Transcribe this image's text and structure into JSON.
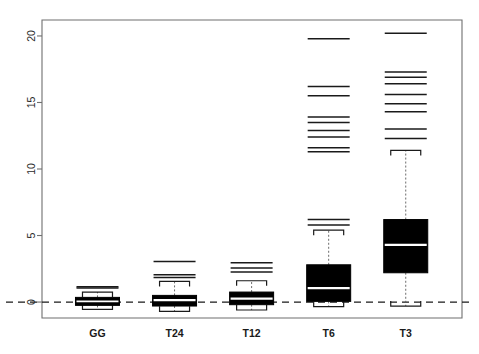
{
  "chart_data": {
    "type": "boxplot",
    "title": "",
    "xlabel": "",
    "ylabel": "",
    "categories": [
      "GG",
      "T24",
      "T12",
      "T6",
      "T3"
    ],
    "ylim": [
      -1.2,
      21.2
    ],
    "yticks": [
      0,
      5,
      10,
      15,
      20
    ],
    "ytick_labels": [
      "0",
      "5",
      "10",
      "15",
      "20"
    ],
    "grid": false,
    "legend": null,
    "reference_line": {
      "value": 0,
      "style": "dashed"
    },
    "boxes": [
      {
        "category": "GG",
        "whisker_low": -0.55,
        "q1": -0.25,
        "median": 0.05,
        "q3": 0.35,
        "whisker_high": 0.75,
        "outliers": [
          1.05,
          1.15
        ]
      },
      {
        "category": "T24",
        "whisker_low": -0.7,
        "q1": -0.3,
        "median": 0.15,
        "q3": 0.5,
        "whisker_high": 1.55,
        "outliers": [
          1.85,
          2.05,
          3.05
        ]
      },
      {
        "category": "T12",
        "whisker_low": -0.6,
        "q1": -0.2,
        "median": 0.25,
        "q3": 0.75,
        "whisker_high": 1.6,
        "outliers": [
          2.25,
          2.55,
          2.95
        ]
      },
      {
        "category": "T6",
        "whisker_low": -0.35,
        "q1": 0.05,
        "median": 1.05,
        "q3": 2.8,
        "whisker_high": 5.4,
        "outliers": [
          5.8,
          6.2,
          11.3,
          11.6,
          12.4,
          12.9,
          13.5,
          13.9,
          15.5,
          16.2,
          19.8
        ]
      },
      {
        "category": "T3",
        "whisker_low": -0.3,
        "q1": 2.2,
        "median": 4.3,
        "q3": 6.2,
        "whisker_high": 11.4,
        "outliers": [
          12.3,
          13.0,
          14.3,
          14.9,
          15.6,
          16.4,
          16.9,
          17.3,
          20.2
        ]
      }
    ],
    "colors": {
      "box_fill": "#000000",
      "median": "#ffffff",
      "axis": "#6f6f6f",
      "text": "#1a1a1a",
      "background": "#ffffff"
    }
  }
}
